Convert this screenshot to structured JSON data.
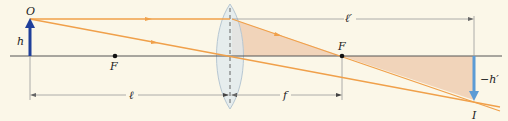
{
  "diagram": {
    "colors": {
      "background": "#fbf7e8",
      "axis": "#555555",
      "ray": "#f0a04a",
      "shaded_triangle": "#efcfb5",
      "object_arrow": "#1f3f9a",
      "image_arrow": "#5b9bd5",
      "lens_fill": "#dfe9ef",
      "lens_stroke": "#b7c7d2",
      "dimension_line": "#888888"
    },
    "labels": {
      "object_point": "O",
      "object_height": "h",
      "focal_point_left": "F",
      "focal_point_right": "F",
      "image_distance": "ℓ′",
      "object_distance": "ℓ",
      "focal_length": "f",
      "image_height": "−h′",
      "image_point": "I"
    }
  }
}
